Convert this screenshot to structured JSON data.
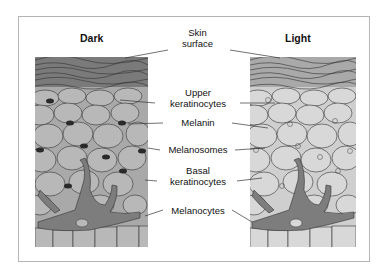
{
  "titles": {
    "left": "Dark",
    "right": "Light"
  },
  "labels": [
    {
      "id": "skin-surface",
      "lines": [
        "Skin",
        "surface"
      ]
    },
    {
      "id": "upper-keratinocytes",
      "lines": [
        "Upper",
        "keratinocytes"
      ]
    },
    {
      "id": "melanin",
      "lines": [
        "Melanin"
      ]
    },
    {
      "id": "melanosomes",
      "lines": [
        "Melanosomes"
      ]
    },
    {
      "id": "basal-keratinocytes",
      "lines": [
        "Basal",
        "keratinocytes"
      ]
    },
    {
      "id": "melanocytes",
      "lines": [
        "Melanocytes"
      ]
    }
  ],
  "colors": {
    "dark_panel": "#a8a8a8",
    "light_panel": "#cdcdcd",
    "melanocyte": "#7d7d7d",
    "melanin": "#2a2a2a",
    "stroke": "#333333"
  }
}
